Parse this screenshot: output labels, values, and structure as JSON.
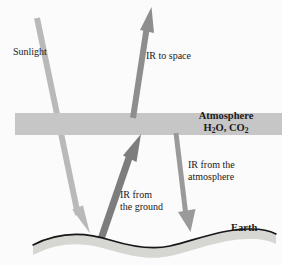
{
  "figure": {
    "background_color": "#fbfbfb"
  },
  "labels": {
    "sunlight": "Sunlight",
    "ir_to_space": "IR to space",
    "atmosphere_line1": "Atmosphere",
    "atmosphere_formula_h2o": "H",
    "atmosphere_formula_h2o_sub": "2",
    "atmosphere_formula_h2o_tail": "O, CO",
    "atmosphere_formula_co2_sub": "2",
    "ir_from_atmosphere_line1": "IR from the",
    "ir_from_atmosphere_line2": "atmosphere",
    "ir_from_ground_line1": "IR from",
    "ir_from_ground_line2": "the ground",
    "earth": "Earth"
  },
  "colors": {
    "sunlight_arrow": "#b9b9b9",
    "ir_to_space_arrow": "#8e8e8e",
    "ir_from_ground_arrow": "#7d7d7d",
    "ir_from_atmosphere_arrow": "#9a9a9a",
    "atmosphere_band": "#c6c6c6",
    "earth_fill": "#d6d6d2",
    "earth_outline": "#171717",
    "text": "#1a1a1a"
  },
  "elements": {
    "atmosphere_band": {
      "x": 15,
      "y": 113,
      "width": 267,
      "height": 22
    },
    "sunlight_arrow": {
      "from": [
        37,
        18
      ],
      "to": [
        81,
        231
      ],
      "width": 6
    },
    "ir_to_space_arrow": {
      "from": [
        133,
        116
      ],
      "to": [
        149,
        10
      ],
      "width": 6
    },
    "ir_from_ground_arrow": {
      "from": [
        100,
        244
      ],
      "to": [
        138,
        137
      ],
      "width": 7
    },
    "ir_from_atmosphere_arrow": {
      "from": [
        176,
        135
      ],
      "to": [
        188,
        230
      ],
      "width": 5
    },
    "earth_surface": {
      "left": 33,
      "right": 276,
      "crest_y": 238,
      "trough_y": 250
    }
  }
}
